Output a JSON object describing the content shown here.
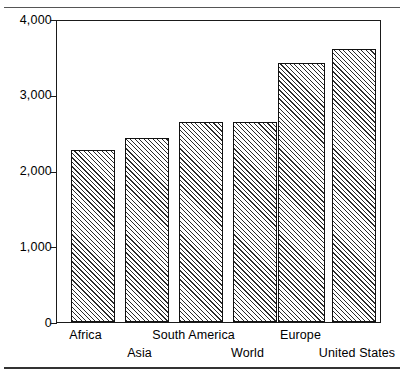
{
  "figure": {
    "top_rule": "horizontal-rule",
    "bottom_rule": "horizontal-rule"
  },
  "chart_data": {
    "type": "bar",
    "title": "",
    "subtitle": "",
    "xlabel": "",
    "ylabel": "",
    "categories": [
      "Africa",
      "Asia",
      "South America",
      "World",
      "Europe",
      "United States"
    ],
    "values": [
      2280,
      2440,
      2660,
      2660,
      3440,
      3630
    ],
    "ylim": [
      0,
      4000
    ],
    "ytick_labels": [
      "0",
      "1,000",
      "2,000",
      "3,000",
      "4,000"
    ],
    "ytick_values": [
      0,
      1000,
      2000,
      3000,
      4000
    ],
    "yminor_values": [
      500,
      1500,
      2500,
      3500
    ],
    "grid": false,
    "legend": null,
    "bar_fill": "diagonal-hatch",
    "bar_edge_color": "#111111",
    "axis_color": "#1a1a1a",
    "background": "#ffffff"
  }
}
